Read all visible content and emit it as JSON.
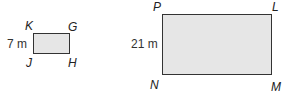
{
  "small_rectangle": {
    "vertices": {
      "top_left": "K",
      "top_right": "G",
      "bottom_left": "J",
      "bottom_right": "H"
    },
    "side_label": "7 m"
  },
  "large_rectangle": {
    "vertices": {
      "top_left": "P",
      "top_right": "L",
      "bottom_left": "N",
      "bottom_right": "M"
    },
    "side_label": "21 m"
  },
  "colors": {
    "fill": "#e6e6e6",
    "stroke": "#333333"
  }
}
